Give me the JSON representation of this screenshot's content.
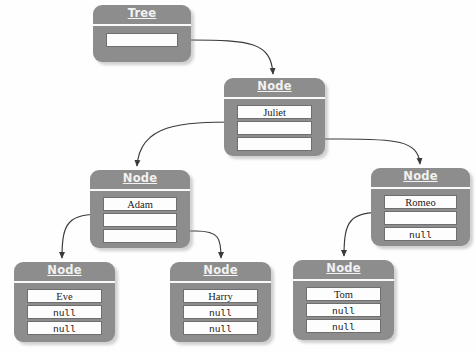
{
  "diagram": {
    "background_color": "#fefefe",
    "object_fill_color": "#8d8d8d",
    "field_fill_color": "#fdfdfd",
    "edge_color": "#3a3a3a",
    "null_text": "null"
  },
  "objects": {
    "tree": {
      "title": "Tree",
      "fields": [
        {
          "name": "root",
          "value": "",
          "kind": "pointer"
        }
      ]
    },
    "juliet": {
      "title": "Node",
      "fields": [
        {
          "name": "data",
          "value": "Juliet",
          "kind": "data"
        },
        {
          "name": "left",
          "value": "",
          "kind": "pointer"
        },
        {
          "name": "right",
          "value": "",
          "kind": "pointer"
        }
      ]
    },
    "adam": {
      "title": "Node",
      "fields": [
        {
          "name": "data",
          "value": "Adam",
          "kind": "data"
        },
        {
          "name": "left",
          "value": "",
          "kind": "pointer"
        },
        {
          "name": "right",
          "value": "",
          "kind": "pointer"
        }
      ]
    },
    "romeo": {
      "title": "Node",
      "fields": [
        {
          "name": "data",
          "value": "Romeo",
          "kind": "data"
        },
        {
          "name": "left",
          "value": "",
          "kind": "pointer"
        },
        {
          "name": "right",
          "value": "null",
          "kind": "null"
        }
      ]
    },
    "eve": {
      "title": "Node",
      "fields": [
        {
          "name": "data",
          "value": "Eve",
          "kind": "data"
        },
        {
          "name": "left",
          "value": "null",
          "kind": "null"
        },
        {
          "name": "right",
          "value": "null",
          "kind": "null"
        }
      ]
    },
    "harry": {
      "title": "Node",
      "fields": [
        {
          "name": "data",
          "value": "Harry",
          "kind": "data"
        },
        {
          "name": "left",
          "value": "null",
          "kind": "null"
        },
        {
          "name": "right",
          "value": "null",
          "kind": "null"
        }
      ]
    },
    "tom": {
      "title": "Node",
      "fields": [
        {
          "name": "data",
          "value": "Tom",
          "kind": "data"
        },
        {
          "name": "left",
          "value": "null",
          "kind": "null"
        },
        {
          "name": "right",
          "value": "null",
          "kind": "null"
        }
      ]
    }
  },
  "edges": [
    {
      "name": "tree-root-to-juliet",
      "from": "tree.root",
      "to": "juliet"
    },
    {
      "name": "juliet-left-to-adam",
      "from": "juliet.left",
      "to": "adam"
    },
    {
      "name": "juliet-right-to-romeo",
      "from": "juliet.right",
      "to": "romeo"
    },
    {
      "name": "adam-left-to-eve",
      "from": "adam.left",
      "to": "eve"
    },
    {
      "name": "adam-right-to-harry",
      "from": "adam.right",
      "to": "harry"
    },
    {
      "name": "romeo-left-to-tom",
      "from": "romeo.left",
      "to": "tom"
    }
  ]
}
